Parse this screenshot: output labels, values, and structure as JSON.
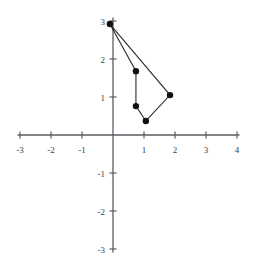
{
  "chart_data": {
    "type": "scatter",
    "title": "",
    "subtitle": "",
    "xlabel": "",
    "ylabel": "",
    "xlim": [
      -3,
      4
    ],
    "ylim": [
      -3,
      3
    ],
    "grid": false,
    "legend": "none",
    "axes": {
      "x_ticks": [
        -3,
        -2,
        -1,
        1,
        2,
        3,
        4
      ],
      "y_ticks": [
        3,
        2,
        1,
        -1,
        -2,
        -3
      ],
      "x_tick_labels": [
        "-3",
        "-2",
        "-1",
        "1",
        "2",
        "3",
        "4"
      ],
      "y_tick_labels": [
        "3",
        "2",
        "1",
        "-1",
        "-2",
        "-3"
      ],
      "origin_label_shown": false
    },
    "annotations": [],
    "series": [
      {
        "name": "polygon",
        "closed": true,
        "marker": "filled-circle",
        "marker_color": "#111111",
        "line_color": "#2c2c2c",
        "points": [
          {
            "x": -0.1,
            "y": 2.92,
            "label": "(-0.1, 2.9)"
          },
          {
            "x": 0.74,
            "y": 1.68,
            "label": "(0.7, 1.7)"
          },
          {
            "x": 0.74,
            "y": 0.76,
            "label": "(0.7, 0.8)"
          },
          {
            "x": 1.06,
            "y": 0.37,
            "label": "(1.1, 0.4)"
          },
          {
            "x": 1.84,
            "y": 1.05,
            "label": "(1.8, 1.1)"
          }
        ]
      }
    ]
  },
  "geometry": {
    "origin_px": {
      "x": 113,
      "y": 135
    },
    "unit_px": {
      "x": 31,
      "y": 38
    },
    "axis_color": "#5c5c66",
    "tick_length": 7,
    "marker_radius": 3.2
  }
}
